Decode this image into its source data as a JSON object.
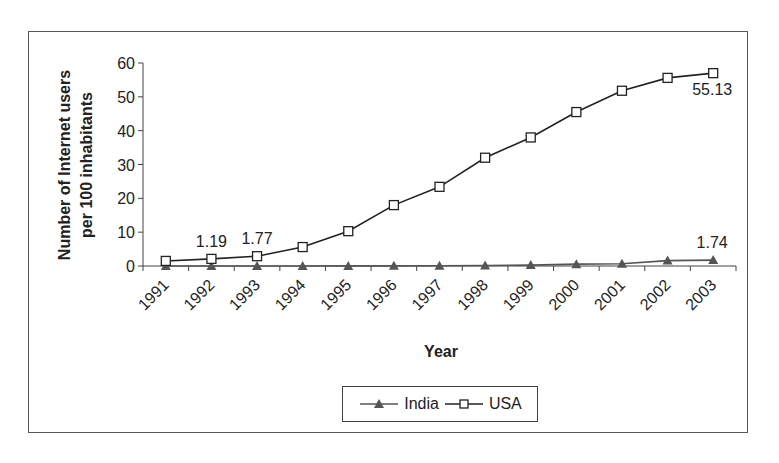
{
  "chart_data": {
    "type": "line",
    "title": "",
    "xlabel": "Year",
    "ylabel": "Number of Internet users per 100 inhabitants",
    "ylabel_lines": [
      "Number of Internet users",
      "per 100 inhabitants"
    ],
    "categories": [
      "1991",
      "1992",
      "1993",
      "1994",
      "1995",
      "1996",
      "1997",
      "1998",
      "1999",
      "2000",
      "2001",
      "2002",
      "2003"
    ],
    "ylim": [
      0,
      60
    ],
    "yticks": [
      0,
      10,
      20,
      30,
      40,
      50,
      60
    ],
    "grid": false,
    "legend_position": "bottom",
    "series": [
      {
        "name": "India",
        "marker": "triangle",
        "color": "#555555",
        "values": [
          0.0,
          0.0,
          0.0,
          0.0,
          0.03,
          0.05,
          0.07,
          0.14,
          0.27,
          0.54,
          0.68,
          1.6,
          1.74
        ]
      },
      {
        "name": "USA",
        "marker": "square",
        "color": "#222222",
        "values": [
          1.5,
          2.1,
          2.9,
          5.6,
          10.3,
          18.0,
          23.4,
          32.0,
          38.0,
          45.5,
          51.8,
          55.6,
          57.0
        ]
      }
    ],
    "annotations": [
      {
        "text": "1.19",
        "category": "1992",
        "series": "USA"
      },
      {
        "text": "1.77",
        "category": "1993",
        "series": "USA"
      },
      {
        "text": "55.13",
        "category": "2003",
        "series": "USA"
      },
      {
        "text": "1.74",
        "category": "2003",
        "series": "India"
      }
    ]
  },
  "legend": {
    "items": [
      {
        "label": "India",
        "icon": "triangle-marker-icon"
      },
      {
        "label": "USA",
        "icon": "square-marker-icon"
      }
    ]
  }
}
